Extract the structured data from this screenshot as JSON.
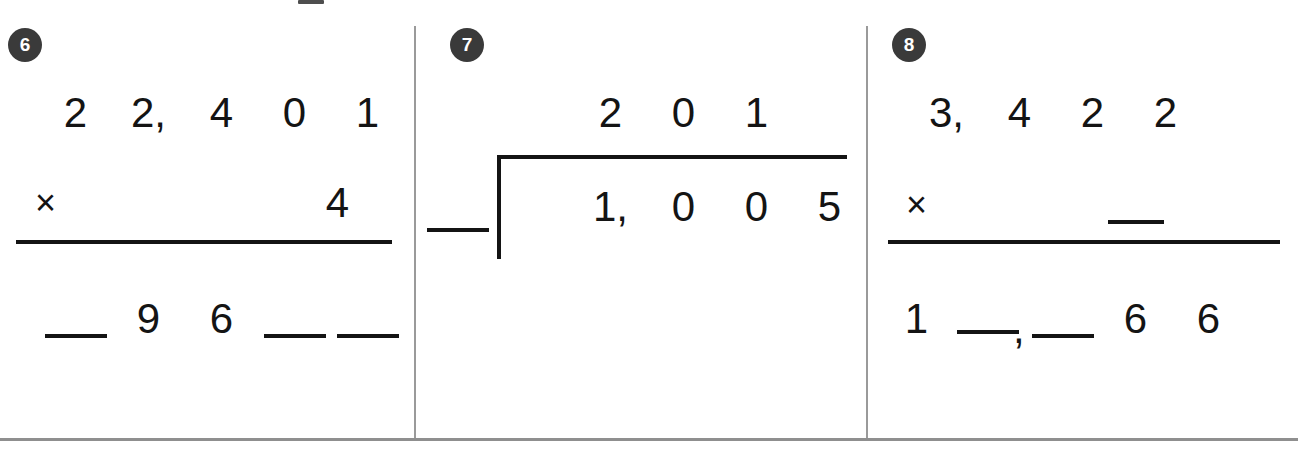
{
  "worksheet": {
    "width": 1298,
    "height": 457,
    "background": "#ffffff",
    "divider_color": "#8f8f8f",
    "badge_color": "#3a3a3a",
    "ink_color": "#141414"
  },
  "problems": [
    {
      "number": "6",
      "type": "multiplication",
      "rows": {
        "top": [
          "2",
          "2,",
          "4",
          "0",
          "1"
        ],
        "multiplier": [
          "×",
          "",
          "",
          "",
          "4"
        ],
        "answer": [
          "blank",
          "9",
          "6",
          "blank",
          "blank"
        ]
      }
    },
    {
      "number": "7",
      "type": "long-division",
      "rows": {
        "quotient": [
          "2",
          "0",
          "1"
        ],
        "dividend": [
          "1,",
          "0",
          "0",
          "5"
        ],
        "divisor": "blank"
      }
    },
    {
      "number": "8",
      "type": "multiplication",
      "rows": {
        "top": [
          "3,",
          "4",
          "2",
          "2"
        ],
        "multiplier": [
          "×",
          "",
          "",
          "blank"
        ],
        "answer": [
          "1",
          "blank-comma",
          "blank",
          "6",
          "6"
        ]
      }
    }
  ]
}
